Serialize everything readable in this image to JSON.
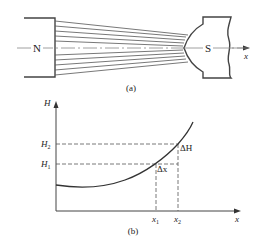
{
  "figure_a": {
    "caption": "(a)",
    "north_label": "N",
    "south_label": "S",
    "axis_label": "x",
    "field_line_count": 10
  },
  "figure_b": {
    "caption": "(b)",
    "y_axis_label": "H",
    "x_axis_label": "x",
    "h2_label": "H",
    "h2_sub": "2",
    "h1_label": "H",
    "h1_sub": "1",
    "x1_label": "x",
    "x1_sub": "1",
    "x2_label": "x",
    "x2_sub": "2",
    "delta_h_label": "ΔH",
    "delta_x_label": "Δx"
  },
  "colors": {
    "line": "#333333",
    "dashed": "#555555",
    "axis_thin": "#777777"
  }
}
